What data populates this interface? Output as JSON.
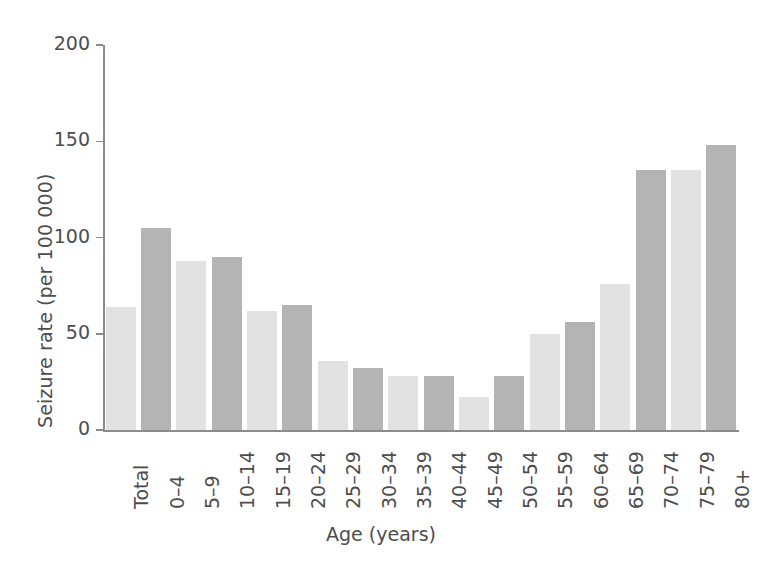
{
  "chart_data": {
    "type": "bar",
    "title": "",
    "xlabel": "Age (years)",
    "ylabel": "Seizure rate (per 100 000)",
    "ylim": [
      0,
      200
    ],
    "yticks": [
      0,
      50,
      100,
      150,
      200
    ],
    "ytick_labels": [
      "0",
      "50",
      "100",
      "150",
      "200"
    ],
    "grid": false,
    "legend": "none",
    "categories": [
      "Total",
      "0–4",
      "5–9",
      "10–14",
      "15–19",
      "20–24",
      "25–29",
      "30–34",
      "35–39",
      "40–44",
      "45–49",
      "50–54",
      "55–59",
      "60–64",
      "65–69",
      "70–74",
      "75–79",
      "80+"
    ],
    "values": [
      64,
      105,
      88,
      90,
      62,
      65,
      36,
      32,
      28,
      28,
      17,
      28,
      50,
      56,
      76,
      135,
      135,
      148
    ],
    "bar_shades": [
      "light",
      "dark",
      "light",
      "dark",
      "light",
      "dark",
      "light",
      "dark",
      "light",
      "dark",
      "light",
      "dark",
      "light",
      "dark",
      "light",
      "dark",
      "light",
      "dark"
    ]
  },
  "colors": {
    "bar_light": "#e2e2e2",
    "bar_dark": "#b4b4b4",
    "axis": "#8c8c8c",
    "text": "#4d4d4d",
    "background": "#ffffff"
  }
}
